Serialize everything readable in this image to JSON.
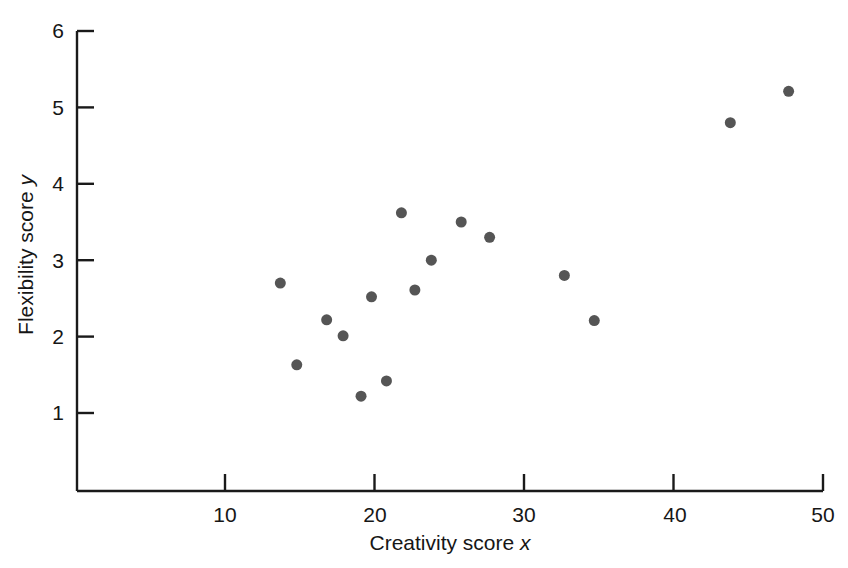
{
  "chart_data": {
    "type": "scatter",
    "title": "",
    "xlabel": "Creativity score x",
    "xlabel_text": "Creativity score",
    "xlabel_var": "x",
    "ylabel": "Flexibility score y",
    "ylabel_text": "Flexibility score",
    "ylabel_var": "y",
    "xlim": [
      2.2,
      50
    ],
    "ylim": [
      0,
      6
    ],
    "xticks": [
      10,
      20,
      30,
      40,
      50
    ],
    "xtick_labels": [
      "10",
      "20",
      "30",
      "40",
      "50"
    ],
    "yticks": [
      1,
      2,
      3,
      4,
      5,
      6
    ],
    "ytick_labels": [
      "1",
      "2",
      "3",
      "4",
      "5",
      "6"
    ],
    "grid": false,
    "legend": null,
    "marker": {
      "shape": "circle",
      "color": "#555555",
      "size_px": 11
    },
    "axis_color": "#1a1a1a",
    "background": "#ffffff",
    "n_points": 16,
    "points": [
      {
        "x": 13.7,
        "y": 2.7
      },
      {
        "x": 14.8,
        "y": 1.63
      },
      {
        "x": 16.8,
        "y": 2.22
      },
      {
        "x": 17.9,
        "y": 2.01
      },
      {
        "x": 19.1,
        "y": 1.22
      },
      {
        "x": 19.8,
        "y": 2.52
      },
      {
        "x": 20.8,
        "y": 1.42
      },
      {
        "x": 21.8,
        "y": 3.62
      },
      {
        "x": 22.7,
        "y": 2.61
      },
      {
        "x": 23.8,
        "y": 3.0
      },
      {
        "x": 25.8,
        "y": 3.5
      },
      {
        "x": 27.7,
        "y": 3.3
      },
      {
        "x": 32.7,
        "y": 2.8
      },
      {
        "x": 34.7,
        "y": 2.21
      },
      {
        "x": 43.8,
        "y": 4.8
      },
      {
        "x": 47.7,
        "y": 5.21
      }
    ]
  }
}
